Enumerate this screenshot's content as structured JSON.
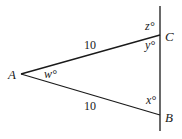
{
  "diagram": {
    "type": "geometry-triangle",
    "points": {
      "A": {
        "label": "A",
        "x": 21,
        "y": 74
      },
      "B": {
        "label": "B",
        "x": 160,
        "y": 115
      },
      "C": {
        "label": "C",
        "x": 160,
        "y": 35
      }
    },
    "line": {
      "x": 160,
      "y_top": 6,
      "y_bottom": 131
    },
    "sides": {
      "AC": {
        "label": "10"
      },
      "AB": {
        "label": "10"
      }
    },
    "angles": {
      "w": {
        "label": "w°",
        "at": "A"
      },
      "x": {
        "label": "x°",
        "at": "B"
      },
      "y": {
        "label": "y°",
        "at": "C"
      },
      "z": {
        "label": "z°",
        "at": "C, exterior"
      }
    },
    "colors": {
      "stroke": "#1a1a1a",
      "background": "#ffffff"
    }
  }
}
